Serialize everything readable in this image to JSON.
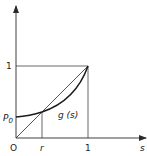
{
  "diagram": {
    "axes": {
      "x_label": "s",
      "origin_label": "O",
      "x_ticks": [
        "r",
        "1"
      ],
      "y_ticks": [
        "1"
      ],
      "y_intercept_label": "P",
      "y_intercept_subscript": "0"
    },
    "curve_label": "g (s)",
    "colors": {
      "line": "#2a2a2a",
      "background": "#ffffff"
    }
  }
}
